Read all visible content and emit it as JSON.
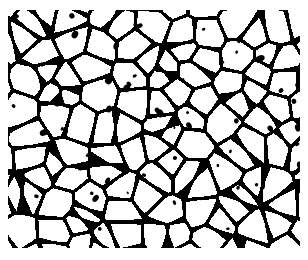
{
  "image": {
    "subject": "metallographic micrograph of polygonal grain structure",
    "description": "White equiaxed grains separated by thick black grain boundaries, with scattered dark inclusions/pores",
    "colors": {
      "background": "#ffffff",
      "grain": "#ffffff",
      "boundary": "#000000"
    },
    "region": {
      "x": 8,
      "y": 10,
      "width": 292,
      "height": 238
    },
    "approx_grain_size_px": 26,
    "boundary_width_px": 3.2
  }
}
